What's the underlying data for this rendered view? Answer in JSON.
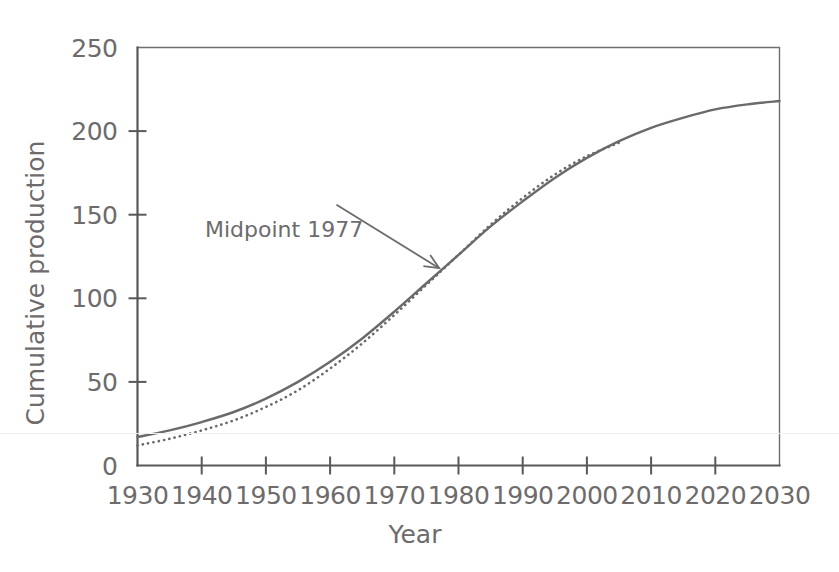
{
  "chart_data": {
    "type": "line",
    "title": "",
    "subtitle": "",
    "xlabel": "Year",
    "ylabel": "Cumulative production",
    "xlim": [
      1930,
      2030
    ],
    "ylim": [
      0,
      250
    ],
    "xticks": [
      1930,
      1940,
      1950,
      1960,
      1970,
      1980,
      1990,
      2000,
      2010,
      2020,
      2030
    ],
    "xticklabels": [
      "1930",
      "1940",
      "1950",
      "1960",
      "1970",
      "1980",
      "1990",
      "2000",
      "2010",
      "2020",
      "2030"
    ],
    "yticks": [
      0,
      50,
      100,
      150,
      200,
      250
    ],
    "yticklabels": [
      "0",
      "50",
      "100",
      "150",
      "200",
      "250"
    ],
    "grid": false,
    "legend": null,
    "series": [
      {
        "name": "cumulative-production-solid",
        "style": "solid",
        "color": "#6a6a6a",
        "x": [
          1930,
          1935,
          1940,
          1945,
          1950,
          1955,
          1960,
          1965,
          1970,
          1975,
          1980,
          1985,
          1990,
          1995,
          2000,
          2005,
          2010,
          2015,
          2020,
          2025,
          2030
        ],
        "values": [
          17,
          21,
          26,
          32,
          40,
          50,
          62,
          76,
          92,
          109,
          126,
          143,
          158,
          172,
          184,
          194,
          202,
          208,
          213,
          216,
          218
        ]
      },
      {
        "name": "cumulative-production-dotted",
        "style": "dotted",
        "color": "#6a6a6a",
        "x": [
          1930,
          1935,
          1940,
          1945,
          1950,
          1955,
          1960,
          1965,
          1970,
          1975,
          1980,
          1985,
          1990,
          1995,
          2000,
          2005
        ],
        "values": [
          12,
          16,
          21,
          27,
          35,
          45,
          58,
          73,
          90,
          108,
          126,
          144,
          160,
          174,
          185,
          193
        ]
      }
    ],
    "annotations": [
      {
        "name": "midpoint-annotation",
        "text": "Midpoint 1977",
        "point": [
          1977,
          118
        ],
        "text_anchor": [
          1961,
          156
        ],
        "arrow": true
      }
    ]
  },
  "axis": {
    "y_title": "Cumulative production",
    "x_title": "Year"
  },
  "annotation": {
    "midpoint_label": "Midpoint 1977"
  }
}
